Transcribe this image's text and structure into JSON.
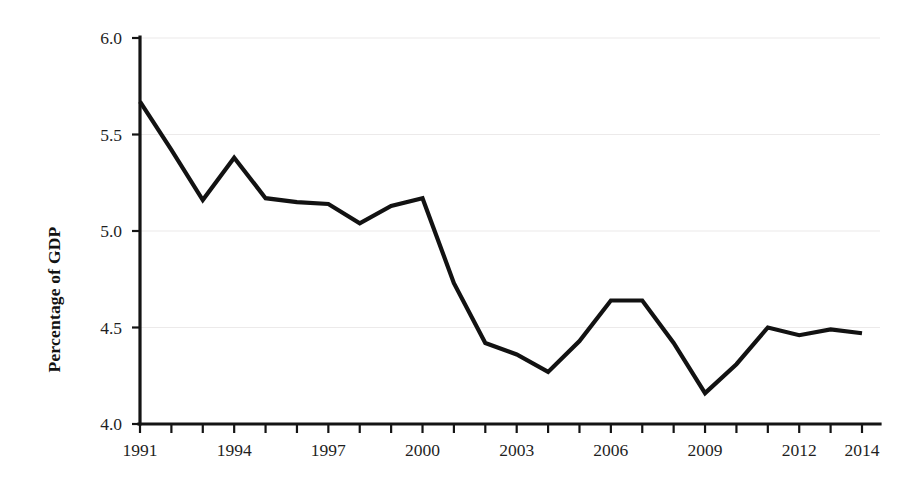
{
  "chart_data": {
    "type": "line",
    "title": "",
    "subtitle": "",
    "xlabel": "",
    "ylabel": "Percentage of GDP",
    "x": [
      1991,
      1992,
      1993,
      1994,
      1995,
      1996,
      1997,
      1998,
      1999,
      2000,
      2001,
      2002,
      2003,
      2004,
      2005,
      2006,
      2007,
      2008,
      2009,
      2010,
      2011,
      2012,
      2013,
      2014
    ],
    "values": [
      5.67,
      5.42,
      5.16,
      5.38,
      5.17,
      5.15,
      5.14,
      5.04,
      5.13,
      5.17,
      4.73,
      4.42,
      4.36,
      4.27,
      4.43,
      4.64,
      4.64,
      4.42,
      4.16,
      4.31,
      4.5,
      4.46,
      4.49,
      4.47
    ],
    "series": [
      {
        "name": "Percentage of GDP",
        "color": "#121212",
        "values": [
          5.67,
          5.42,
          5.16,
          5.38,
          5.17,
          5.15,
          5.14,
          5.04,
          5.13,
          5.17,
          4.73,
          4.42,
          4.36,
          4.27,
          4.43,
          4.64,
          4.64,
          4.42,
          4.16,
          4.31,
          4.5,
          4.46,
          4.49,
          4.47
        ]
      }
    ],
    "xlim": [
      1991,
      2014
    ],
    "ylim": [
      4.0,
      6.0
    ],
    "ytick_labels": [
      "6.0",
      "5.5",
      "5.0",
      "4.5",
      "4.0"
    ],
    "ytick_values": [
      6.0,
      5.5,
      5.0,
      4.5,
      4.0
    ],
    "xtick_values": [
      1991,
      1992,
      1993,
      1994,
      1995,
      1996,
      1997,
      1998,
      1999,
      2000,
      2001,
      2002,
      2003,
      2004,
      2005,
      2006,
      2007,
      2008,
      2009,
      2010,
      2011,
      2012,
      2013,
      2014
    ],
    "xtick_labels_shown": [
      "1991",
      "1994",
      "1997",
      "2000",
      "2003",
      "2006",
      "2009",
      "2012",
      "2014"
    ],
    "grid": "horizontal",
    "legend": "none",
    "line_color": "#121212",
    "grid_color": "#eceaea",
    "axis_color": "#141414",
    "background": "#ffffff"
  }
}
